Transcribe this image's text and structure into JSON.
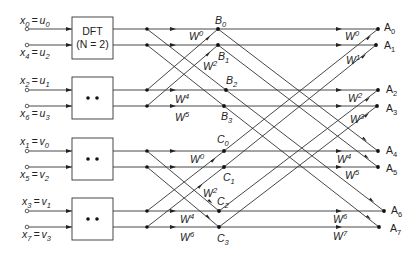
{
  "inputs": [
    {
      "x": "x",
      "xi": "0",
      "u": "u",
      "ui": "0"
    },
    {
      "x": "x",
      "xi": "4",
      "u": "u",
      "ui": "2"
    },
    {
      "x": "x",
      "xi": "2",
      "u": "u",
      "ui": "1"
    },
    {
      "x": "x",
      "xi": "6",
      "u": "u",
      "ui": "3"
    },
    {
      "x": "x",
      "xi": "1",
      "u": "v",
      "ui": "0"
    },
    {
      "x": "x",
      "xi": "5",
      "u": "v",
      "ui": "2"
    },
    {
      "x": "x",
      "xi": "3",
      "u": "v",
      "ui": "1"
    },
    {
      "x": "x",
      "xi": "7",
      "u": "v",
      "ui": "3"
    }
  ],
  "boxes": [
    {
      "line1": "DFT",
      "line2": "(N = 2)"
    },
    {
      "dots": "• •"
    },
    {
      "dots": "• •"
    },
    {
      "dots": "• •"
    }
  ],
  "stage1_nodes": {
    "B": [
      {
        "n": "B",
        "i": "0"
      },
      {
        "n": "B",
        "i": "1"
      },
      {
        "n": "B",
        "i": "2"
      },
      {
        "n": "B",
        "i": "3"
      }
    ],
    "C": [
      {
        "n": "C",
        "i": "0"
      },
      {
        "n": "C",
        "i": "1"
      },
      {
        "n": "C",
        "i": "2"
      },
      {
        "n": "C",
        "i": "3"
      }
    ]
  },
  "stage1_twiddles": [
    {
      "w": "W",
      "e": "0"
    },
    {
      "w": "W",
      "e": "2"
    },
    {
      "w": "W",
      "e": "4"
    },
    {
      "w": "W",
      "e": "5"
    },
    {
      "w": "W",
      "e": "0"
    },
    {
      "w": "W",
      "e": "2"
    },
    {
      "w": "W",
      "e": "4"
    },
    {
      "w": "W",
      "e": "6"
    }
  ],
  "outputs": [
    {
      "n": "A",
      "i": "0"
    },
    {
      "n": "A",
      "i": "1"
    },
    {
      "n": "A",
      "i": "2"
    },
    {
      "n": "A",
      "i": "3"
    },
    {
      "n": "A",
      "i": "4"
    },
    {
      "n": "A",
      "i": "5"
    },
    {
      "n": "A",
      "i": "6"
    },
    {
      "n": "A",
      "i": "7"
    }
  ],
  "stage2_twiddles": [
    {
      "w": "W",
      "e": "0"
    },
    {
      "w": "W",
      "e": "1"
    },
    {
      "w": "W",
      "e": "2"
    },
    {
      "w": "W",
      "e": "3"
    },
    {
      "w": "W",
      "e": "4"
    },
    {
      "w": "W",
      "e": "5"
    },
    {
      "w": "W",
      "e": "6"
    },
    {
      "w": "W",
      "e": "7"
    }
  ]
}
